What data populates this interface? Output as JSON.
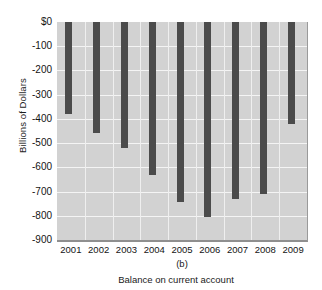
{
  "chart_data": {
    "type": "bar",
    "title": "",
    "panel_label": "(b)",
    "xlabel": "Balance on current account",
    "ylabel": "Billions of Dollars",
    "categories": [
      "2001",
      "2002",
      "2003",
      "2004",
      "2005",
      "2006",
      "2007",
      "2008",
      "2009"
    ],
    "values": [
      -380,
      -460,
      -520,
      -630,
      -745,
      -805,
      -730,
      -710,
      -420
    ],
    "ylim": [
      -900,
      0
    ],
    "ytick_labels": [
      "$0",
      "-100",
      "-200",
      "-300",
      "-400",
      "-500",
      "-600",
      "-700",
      "-800",
      "-900"
    ],
    "ytick_values": [
      0,
      -100,
      -200,
      -300,
      -400,
      -500,
      -600,
      -700,
      -800,
      -900
    ],
    "grid": true,
    "legend": null,
    "colors": {
      "bar": "#4b4b4b",
      "plot_background": "#d2d2d2",
      "gridline": "#f4f4f4",
      "axis": "#8f8f8f",
      "text": "#141414"
    }
  }
}
